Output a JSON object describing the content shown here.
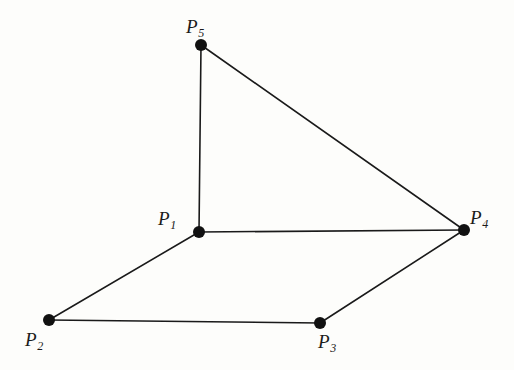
{
  "figure": {
    "kind": "graph-diagram",
    "background_color": "#fdfdfb",
    "line_color": "#1a1a1a",
    "vertex_color": "#111111",
    "label_color": "#1a1a1a",
    "width": 514,
    "height": 370,
    "vertices": [
      {
        "id": "P1",
        "letter": "P",
        "index": "1",
        "label": "P1",
        "x": 199,
        "y": 232,
        "r": 6,
        "label_x": 158,
        "label_y": 209
      },
      {
        "id": "P2",
        "letter": "P",
        "index": "2",
        "label": "P2",
        "x": 49,
        "y": 320,
        "r": 6,
        "label_x": 25,
        "label_y": 330
      },
      {
        "id": "P3",
        "letter": "P",
        "index": "3",
        "label": "P3",
        "x": 320,
        "y": 323,
        "r": 6,
        "label_x": 318,
        "label_y": 332
      },
      {
        "id": "P4",
        "letter": "P",
        "index": "4",
        "label": "P4",
        "x": 464,
        "y": 230,
        "r": 6,
        "label_x": 470,
        "label_y": 208
      },
      {
        "id": "P5",
        "letter": "P",
        "index": "5",
        "label": "P5",
        "x": 201,
        "y": 45,
        "r": 6,
        "label_x": 186,
        "label_y": 17
      }
    ],
    "edges": [
      {
        "from": "P5",
        "to": "P1",
        "x1": 201,
        "y1": 45,
        "x2": 199,
        "y2": 232
      },
      {
        "from": "P5",
        "to": "P4",
        "x1": 201,
        "y1": 45,
        "x2": 464,
        "y2": 230
      },
      {
        "from": "P1",
        "to": "P4",
        "x1": 199,
        "y1": 232,
        "x2": 464,
        "y2": 230
      },
      {
        "from": "P1",
        "to": "P2",
        "x1": 199,
        "y1": 232,
        "x2": 49,
        "y2": 320
      },
      {
        "from": "P2",
        "to": "P3",
        "x1": 49,
        "y1": 320,
        "x2": 320,
        "y2": 323
      },
      {
        "from": "P3",
        "to": "P4",
        "x1": 320,
        "y1": 323,
        "x2": 464,
        "y2": 230
      }
    ],
    "edge_width": 1.6
  }
}
